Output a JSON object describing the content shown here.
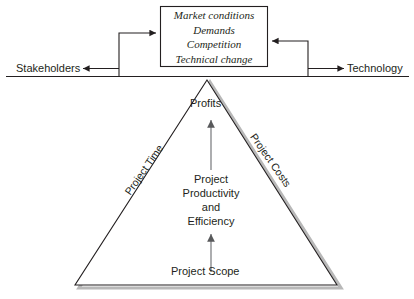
{
  "diagram": {
    "background_color": "#ffffff",
    "line_color": "#231f20",
    "shadow_color": "#b3b3b3",
    "arrow_color": "#6d6e71"
  },
  "factors_box": {
    "name": "external-factors-box",
    "lines": [
      "Market conditions",
      "Demands",
      "Competition",
      "Technical change"
    ],
    "text": "Market conditions\nDemands\nCompetition\nTechnical change"
  },
  "axis": {
    "left_label": "Stakeholders",
    "right_label": "Technology",
    "left_arrow_direction": "left",
    "right_arrow_direction": "right"
  },
  "triangle": {
    "apex_label": "Profits",
    "left_edge_label": "Project Time",
    "right_edge_label": "Project Costs",
    "base_label": "Project Scope",
    "center_label": "Project\nProductivity\nand\nEfficiency",
    "center_lines": [
      "Project",
      "Productivity",
      "and",
      "Efficiency"
    ]
  },
  "flow_arrows": [
    {
      "name": "scope-to-productivity-arrow",
      "from": "Project Scope",
      "to": "Project Productivity and Efficiency",
      "direction": "up"
    },
    {
      "name": "productivity-to-profits-arrow",
      "from": "Project Productivity and Efficiency",
      "to": "Profits",
      "direction": "up"
    },
    {
      "name": "axis-to-factors-left-arrow",
      "from": "axis",
      "to": "external factors box",
      "direction": "right"
    },
    {
      "name": "axis-to-factors-right-arrow",
      "from": "axis",
      "to": "external factors box",
      "direction": "left"
    }
  ]
}
